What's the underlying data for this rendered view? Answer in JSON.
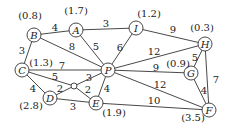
{
  "graph": {
    "nodes": [
      {
        "id": "A",
        "label": "A",
        "value": "(1.7)",
        "x": 76,
        "y": 30,
        "vx": 76,
        "vy": 10
      },
      {
        "id": "B",
        "label": "B",
        "value": "(0.8)",
        "x": 34,
        "y": 35,
        "vx": 30,
        "vy": 15
      },
      {
        "id": "C",
        "label": "C",
        "value": "(1.3)",
        "x": 22,
        "y": 70,
        "vx": 41,
        "vy": 62
      },
      {
        "id": "D",
        "label": "D",
        "value": "(2.8)",
        "x": 50,
        "y": 98,
        "vx": 31,
        "vy": 105
      },
      {
        "id": "E",
        "label": "E",
        "value": "(1.9)",
        "x": 96,
        "y": 103,
        "vx": 114,
        "vy": 112
      },
      {
        "id": "P",
        "label": "P",
        "value": "",
        "x": 108,
        "y": 70
      },
      {
        "id": "I",
        "label": "I",
        "value": "(1.2)",
        "x": 136,
        "y": 28,
        "vx": 149,
        "vy": 13
      },
      {
        "id": "H",
        "label": "H",
        "value": "(0.3)",
        "x": 205,
        "y": 44,
        "vx": 202,
        "vy": 27
      },
      {
        "id": "G",
        "label": "G",
        "value": "(0.9)",
        "x": 191,
        "y": 73,
        "vx": 178,
        "vy": 63
      },
      {
        "id": "F",
        "label": "F",
        "value": "(3.5)",
        "x": 209,
        "y": 110,
        "vx": 193,
        "vy": 117
      },
      {
        "id": "O",
        "label": "",
        "value": "",
        "x": 74,
        "y": 86,
        "small": true
      }
    ],
    "edges": [
      {
        "from": "B",
        "to": "A",
        "weight": "4",
        "lx": 55,
        "ly": 27
      },
      {
        "from": "A",
        "to": "I",
        "weight": "3",
        "lx": 106,
        "ly": 23
      },
      {
        "from": "I",
        "to": "H",
        "weight": "9",
        "lx": 173,
        "ly": 29
      },
      {
        "from": "B",
        "to": "C",
        "weight": "3",
        "lx": 22,
        "ly": 50
      },
      {
        "from": "B",
        "to": "P",
        "weight": "8",
        "lx": 72,
        "ly": 46
      },
      {
        "from": "A",
        "to": "P",
        "weight": "5",
        "lx": 96,
        "ly": 46
      },
      {
        "from": "I",
        "to": "P",
        "weight": "6",
        "lx": 120,
        "ly": 47
      },
      {
        "from": "C",
        "to": "P",
        "weight": "7",
        "lx": 62,
        "ly": 65
      },
      {
        "from": "C",
        "to": "O",
        "weight": "5",
        "lx": 55,
        "ly": 76
      },
      {
        "from": "O",
        "to": "P",
        "weight": "3",
        "lx": 89,
        "ly": 77
      },
      {
        "from": "C",
        "to": "D",
        "weight": "4",
        "lx": 33,
        "ly": 88
      },
      {
        "from": "D",
        "to": "O",
        "weight": "2",
        "lx": 60,
        "ly": 88
      },
      {
        "from": "O",
        "to": "E",
        "weight": "2",
        "lx": 88,
        "ly": 89
      },
      {
        "from": "D",
        "to": "E",
        "weight": "3",
        "lx": 73,
        "ly": 106
      },
      {
        "from": "P",
        "to": "E",
        "weight": "4",
        "lx": 107,
        "ly": 88
      },
      {
        "from": "P",
        "to": "H",
        "weight": "12",
        "lx": 154,
        "ly": 51
      },
      {
        "from": "P",
        "to": "G",
        "weight": "9",
        "lx": 156,
        "ly": 67
      },
      {
        "from": "P",
        "to": "F",
        "weight": "12",
        "lx": 160,
        "ly": 84
      },
      {
        "from": "E",
        "to": "F",
        "weight": "10",
        "lx": 154,
        "ly": 100
      },
      {
        "from": "H",
        "to": "G",
        "weight": "5",
        "lx": 195,
        "ly": 57
      },
      {
        "from": "H",
        "to": "F",
        "weight": "7",
        "lx": 216,
        "ly": 79
      },
      {
        "from": "G",
        "to": "F",
        "weight": "4",
        "lx": 204,
        "ly": 90
      }
    ]
  }
}
